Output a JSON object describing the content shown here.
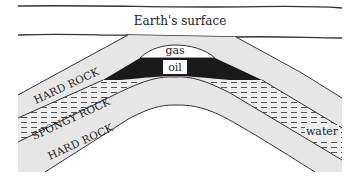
{
  "diagram": {
    "labels": {
      "surface": "Earth's surface",
      "gas": "gas",
      "oil": "oil",
      "water": "water",
      "hard_rock_upper": "HARD ROCK",
      "spongy_rock": "SPONGY ROCK",
      "hard_rock_lower": "HARD ROCK"
    },
    "colors": {
      "background": "#ffffff",
      "hard_rock": "#e6e6e6",
      "spongy_rock": "#eeeeee",
      "gas": "#ffffff",
      "oil": "#1a1a1a",
      "line": "#333333",
      "dash": "#444444"
    },
    "layers": [
      {
        "name": "Earth's surface",
        "type": "surface"
      },
      {
        "name": "HARD ROCK",
        "type": "cap rock"
      },
      {
        "name": "gas",
        "type": "trapped gas"
      },
      {
        "name": "oil",
        "type": "trapped oil"
      },
      {
        "name": "SPONGY ROCK",
        "type": "reservoir rock"
      },
      {
        "name": "water",
        "type": "groundwater"
      },
      {
        "name": "HARD ROCK",
        "type": "base rock"
      }
    ]
  }
}
